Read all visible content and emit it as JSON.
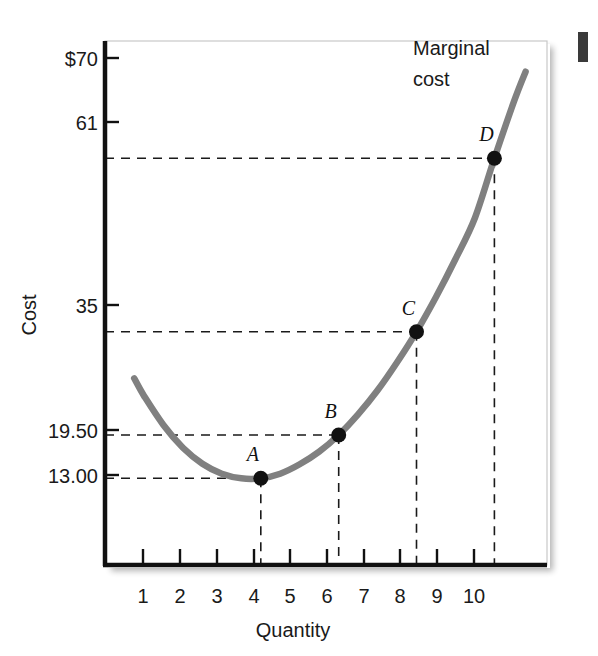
{
  "chart_data": {
    "type": "line",
    "title": "",
    "xlabel": "Quantity",
    "ylabel": "Cost",
    "series_label_line1": "Marginal",
    "series_label_line2": "cost",
    "series_name": "Marginal cost",
    "curve_color": "#808080",
    "axis_color": "#111111",
    "guide_color": "#1a1a1a",
    "grid": false,
    "legend_position": "inline-right-top",
    "xlim": [
      0,
      11.35
    ],
    "ylim": [
      0,
      78.6
    ],
    "x_ticks": [
      1,
      2,
      3,
      4,
      5,
      6,
      7,
      8,
      9,
      10
    ],
    "x_tick_labels": [
      "1",
      "2",
      "3",
      "4",
      "5",
      "6",
      "7",
      "8",
      "9",
      "10"
    ],
    "y_ticks": [
      70,
      61,
      35,
      19.5,
      13
    ],
    "y_tick_labels": [
      "$70",
      "61",
      "35",
      "19.50",
      "13.00"
    ],
    "points": [
      {
        "label": "A",
        "x": 4,
        "y": 13.0,
        "x_label": "4",
        "y_label": "13.00"
      },
      {
        "label": "B",
        "x": 6,
        "y": 19.5,
        "x_label": "6",
        "y_label": "19.50"
      },
      {
        "label": "C",
        "x": 8,
        "y": 35.0,
        "x_label": "8",
        "y_label": "35"
      },
      {
        "label": "D",
        "x": 10,
        "y": 61.0,
        "x_label": "10",
        "y_label": "61"
      }
    ],
    "curve": {
      "x": [
        0.75,
        1.0,
        1.5,
        2.0,
        2.5,
        3.0,
        3.5,
        4.0,
        4.5,
        5.0,
        5.5,
        6.0,
        6.5,
        7.0,
        7.5,
        8.0,
        8.5,
        9.0,
        9.5,
        10.0,
        10.5,
        10.8
      ],
      "y": [
        28.0,
        25.4,
        21.0,
        17.6,
        15.2,
        13.7,
        13.0,
        13.0,
        13.7,
        15.1,
        17.0,
        19.5,
        22.6,
        26.2,
        30.4,
        35.0,
        40.2,
        45.9,
        52.1,
        61.0,
        69.5,
        74.0
      ]
    },
    "dashed_guides": {
      "horizontal": [
        13.0,
        19.5,
        35.0,
        61.0
      ],
      "vertical": [
        4,
        6,
        8,
        10
      ]
    }
  },
  "figure": {
    "page_mark": ""
  }
}
